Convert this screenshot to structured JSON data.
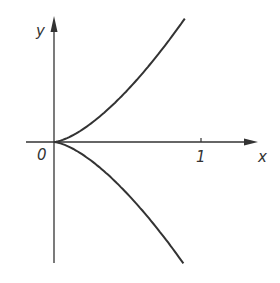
{
  "chart_data": {
    "type": "line",
    "title": "",
    "xlabel": "x",
    "ylabel": "y",
    "origin_label": "0",
    "x_ticks": [
      {
        "value": 1,
        "label": "1"
      }
    ],
    "xlim": [
      -0.19,
      1.39
    ],
    "ylim": [
      -0.83,
      0.86
    ],
    "grid": false,
    "legend": null,
    "series": [
      {
        "name": "upper branch y = x^(3/2)",
        "x": [
          0,
          0.1,
          0.2,
          0.3,
          0.4,
          0.5,
          0.6,
          0.7,
          0.8,
          0.89
        ],
        "y": [
          0,
          0.032,
          0.089,
          0.164,
          0.253,
          0.354,
          0.465,
          0.586,
          0.716,
          0.84
        ]
      },
      {
        "name": "lower branch y = -x^(3/2)",
        "x": [
          0,
          0.1,
          0.2,
          0.3,
          0.4,
          0.5,
          0.6,
          0.7,
          0.8,
          0.88
        ],
        "y": [
          0,
          -0.032,
          -0.089,
          -0.164,
          -0.253,
          -0.354,
          -0.465,
          -0.586,
          -0.716,
          -0.83
        ]
      }
    ]
  },
  "colors": {
    "stroke": "#333333",
    "background": "#ffffff"
  }
}
